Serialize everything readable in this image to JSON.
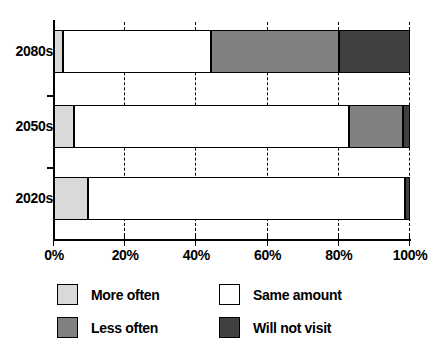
{
  "chart_data": {
    "type": "bar",
    "orientation": "horizontal",
    "stacked": true,
    "stacked_percent": true,
    "title": "",
    "subtitle": "",
    "xlabel": "",
    "ylabel": "",
    "categories": [
      "2080s",
      "2050s",
      "2020s"
    ],
    "x_tick_labels": [
      "0%",
      "20%",
      "40%",
      "60%",
      "80%",
      "100%"
    ],
    "x_ticks": [
      0,
      20,
      40,
      60,
      80,
      100
    ],
    "xlim": [
      0,
      100
    ],
    "grid": "vertical-dashed",
    "legend_position": "bottom-left",
    "series": [
      {
        "name": "More often",
        "color": "#d9d9d9",
        "values": [
          2.5,
          5.5,
          9.5
        ]
      },
      {
        "name": "Same amount",
        "color": "#ffffff",
        "values": [
          41.5,
          77.5,
          89.0
        ]
      },
      {
        "name": "Less often",
        "color": "#808080",
        "values": [
          36.0,
          15.0,
          0.0
        ]
      },
      {
        "name": "Will not visit",
        "color": "#404040",
        "values": [
          20.0,
          2.0,
          1.5
        ]
      }
    ]
  },
  "legend": {
    "items": [
      {
        "label": "More often",
        "color": "#d9d9d9"
      },
      {
        "label": "Same amount",
        "color": "#ffffff"
      },
      {
        "label": "Less often",
        "color": "#808080"
      },
      {
        "label": "Will not visit",
        "color": "#404040"
      }
    ]
  },
  "colors": {
    "more_often": "#d9d9d9",
    "same_amount": "#ffffff",
    "less_often": "#808080",
    "will_not_visit": "#404040",
    "axis": "#000000",
    "background": "#ffffff"
  }
}
